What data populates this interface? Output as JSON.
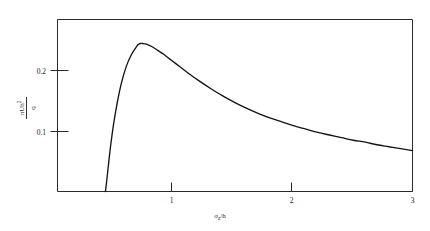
{
  "figure": {
    "name": "dimensionless-profile-plot",
    "background": "#ffffff",
    "curve_color": "#141414",
    "axis_color": "#2b2b2b"
  },
  "axes": {
    "x": {
      "label_numerator": "σ",
      "label_numerator_sub": "z",
      "label_slash": "/",
      "label_denominator": "h",
      "label_full": "σz/h",
      "ticks": [
        {
          "value": 1,
          "text": "1"
        },
        {
          "value": 2,
          "text": "2"
        },
        {
          "value": 3,
          "text": "3"
        }
      ],
      "min": 0,
      "max": 3
    },
    "y": {
      "label_numerator_a": "π",
      "label_numerator_b": "U",
      "label_numerator_c": "h",
      "label_numerator_exp": "2",
      "label_denominator": "q",
      "label_full": "πUh²/q",
      "ticks": [
        {
          "value": 0.1,
          "text": "0.1"
        },
        {
          "value": 0.2,
          "text": "0.2"
        }
      ],
      "min": 0,
      "max": 0.265
    }
  },
  "chart_data": {
    "type": "line",
    "title": "",
    "subtitle": "",
    "xlabel": "σz/h",
    "ylabel": "πUh²/q",
    "xlim": [
      0,
      3
    ],
    "ylim": [
      0,
      0.265
    ],
    "xticks": [
      1,
      2,
      3
    ],
    "yticks": [
      0.1,
      0.2
    ],
    "grid": false,
    "legend": null,
    "legend_position": "none",
    "annotations": [],
    "series": [
      {
        "name": "dimensionless curve",
        "color": "#141414",
        "x": [
          0.405,
          0.415,
          0.43,
          0.45,
          0.475,
          0.505,
          0.54,
          0.58,
          0.625,
          0.675,
          0.68,
          0.7,
          0.72,
          0.75,
          0.8,
          0.85,
          0.9,
          0.95,
          1.0,
          1.1,
          1.2,
          1.3,
          1.4,
          1.5,
          1.6,
          1.7,
          1.8,
          1.9,
          2.0,
          2.1,
          2.2,
          2.3,
          2.4,
          2.5,
          2.6,
          2.7,
          2.8,
          2.9,
          3.0
        ],
        "y": [
          0.0,
          0.015,
          0.04,
          0.072,
          0.105,
          0.137,
          0.167,
          0.192,
          0.211,
          0.225,
          0.226,
          0.228,
          0.228,
          0.227,
          0.223,
          0.217,
          0.211,
          0.204,
          0.197,
          0.183,
          0.17,
          0.158,
          0.147,
          0.137,
          0.128,
          0.12,
          0.113,
          0.107,
          0.101,
          0.096,
          0.091,
          0.087,
          0.083,
          0.079,
          0.076,
          0.072,
          0.069,
          0.066,
          0.063
        ]
      }
    ]
  }
}
